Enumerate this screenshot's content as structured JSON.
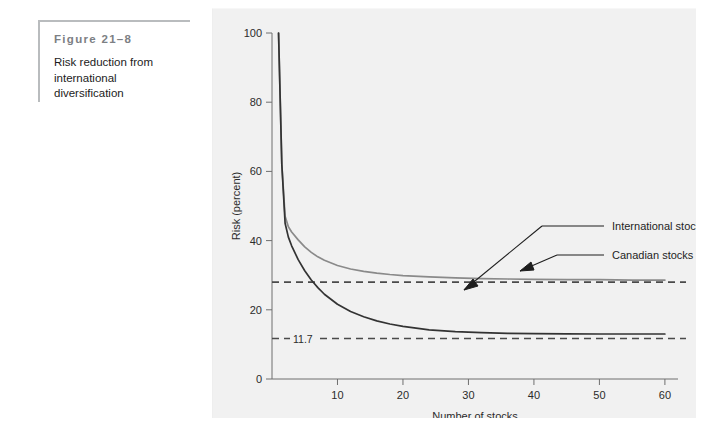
{
  "caption": {
    "figure_number": "Figure 21–8",
    "description": "Risk reduction from international diversification"
  },
  "chart_data": {
    "type": "line",
    "title": "",
    "xlabel": "Number of stocks",
    "ylabel": "Risk (percent)",
    "xlim": [
      0,
      62
    ],
    "ylim": [
      0,
      100
    ],
    "xticks": [
      10,
      20,
      30,
      40,
      50,
      60
    ],
    "xtick_labels": [
      "10",
      "20",
      "30",
      "40",
      "50",
      "60"
    ],
    "yticks": [
      0,
      20,
      40,
      60,
      80,
      100
    ],
    "ytick_labels": [
      "0",
      "20",
      "40",
      "60",
      "80",
      "100"
    ],
    "grid": false,
    "legend_position": "inline-annotations",
    "series": [
      {
        "name": "Canadian stocks",
        "color": "#8a8a8a",
        "style": "solid",
        "asymptote": 28.0,
        "x": [
          1,
          1.5,
          2,
          2.5,
          3,
          4,
          5,
          6,
          7,
          8,
          10,
          12,
          14,
          16,
          18,
          20,
          24,
          28,
          32,
          36,
          40,
          45,
          50,
          55,
          60
        ],
        "y": [
          100,
          62,
          47,
          44,
          42.5,
          40.2,
          38.2,
          36.6,
          35.3,
          34.3,
          32.8,
          31.8,
          31.1,
          30.6,
          30.2,
          29.9,
          29.5,
          29.2,
          29.0,
          28.9,
          28.8,
          28.7,
          28.7,
          28.6,
          28.6
        ]
      },
      {
        "name": "International stocks",
        "color": "#333333",
        "style": "solid",
        "asymptote": 13.0,
        "x": [
          1,
          1.5,
          2,
          2.5,
          3,
          4,
          5,
          6,
          7,
          8,
          10,
          12,
          14,
          16,
          18,
          20,
          24,
          28,
          32,
          36,
          40,
          45,
          50,
          55,
          60
        ],
        "y": [
          100,
          62,
          45,
          41,
          38.5,
          34.5,
          31.3,
          28.6,
          26.4,
          24.5,
          21.6,
          19.5,
          18.0,
          16.8,
          15.9,
          15.2,
          14.2,
          13.7,
          13.4,
          13.2,
          13.1,
          13.05,
          13.0,
          13.0,
          13.0
        ]
      }
    ],
    "reference_lines": [
      {
        "name": "canadian-asymptote",
        "value": 28.0,
        "label": "",
        "style": "dashed",
        "color": "#4a4a4a"
      },
      {
        "name": "international-asymptote",
        "value": 11.7,
        "label": "11.7",
        "style": "dashed",
        "color": "#4a4a4a"
      }
    ],
    "annotations": [
      {
        "name": "international-stocks-annotation",
        "text": "International stocks",
        "text_x": 400,
        "text_y": 222
      },
      {
        "name": "canadian-stocks-annotation",
        "text": "Canadian stocks",
        "text_x": 400,
        "text_y": 251
      }
    ]
  }
}
